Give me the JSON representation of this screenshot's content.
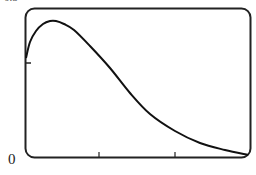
{
  "chart_data": {
    "type": "line",
    "title": "",
    "xlabel": "",
    "ylabel": "",
    "origin_label": "0",
    "top_label": "0.5",
    "frame": {
      "style": "rounded-rectangle",
      "stroke": "#222222"
    },
    "x_ticks": [
      0,
      1,
      2
    ],
    "y_ticks": [
      0.5
    ],
    "grid": false,
    "legend": null,
    "series": [
      {
        "name": "f(x)",
        "color": "#111111",
        "points_px": [
          [
            26,
            58
          ],
          [
            30,
            42
          ],
          [
            36,
            31
          ],
          [
            43,
            24
          ],
          [
            50,
            21
          ],
          [
            56,
            21
          ],
          [
            64,
            24
          ],
          [
            74,
            30
          ],
          [
            90,
            46
          ],
          [
            110,
            68
          ],
          [
            130,
            93
          ],
          [
            150,
            114
          ],
          [
            175,
            131
          ],
          [
            200,
            143
          ],
          [
            225,
            150
          ],
          [
            248,
            155
          ]
        ]
      }
    ]
  }
}
